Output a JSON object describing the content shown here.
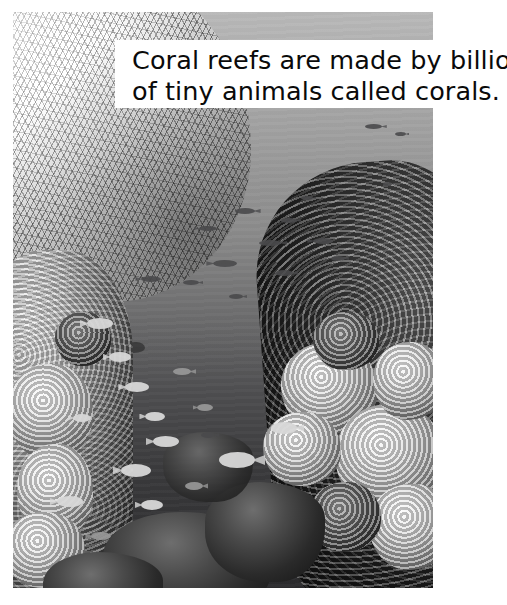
{
  "page": {
    "background_color": "#ffffff",
    "width": 507,
    "height": 605
  },
  "photo": {
    "name": "coral-reef-underwater-photograph",
    "description": "Black and white underwater photograph of a coral reef with small fish swimming over open water, bright branching coral at upper left, dense coral walls on the left and right, and dark rocky reef in the foreground.",
    "palette": {
      "water_light": "#b9b9b9",
      "water_mid": "#8b8b8b",
      "water_dark": "#2b2b2d",
      "coral_bright": "#ffffff",
      "coral_shadow": "#131313",
      "fish_dark": "#4a4a4c",
      "fish_pale": "#d8d8d8"
    }
  },
  "caption": {
    "name": "coral-reef-caption",
    "background_color": "#ffffff",
    "text_color": "#0a0a0a",
    "line1": "Coral reefs are made by billions",
    "line2": "of tiny animals called corals.",
    "full_text": "Coral reefs are made by billions of tiny animals called corals."
  }
}
